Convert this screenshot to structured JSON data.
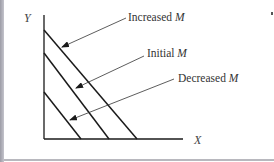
{
  "diagram": {
    "axes": {
      "y_label": "Y",
      "x_label": "X"
    },
    "lines": [
      {
        "name": "Increased M",
        "label_text": "Increased ",
        "label_var": "M",
        "x0": 44,
        "y0": 30,
        "x1": 137,
        "y1": 139
      },
      {
        "name": "Initial M",
        "label_text": "Initial ",
        "label_var": "M",
        "x0": 44,
        "y0": 53,
        "x1": 109,
        "y1": 139
      },
      {
        "name": "Decreased M",
        "label_text": "Decreased ",
        "label_var": "M",
        "x0": 44,
        "y0": 92,
        "x1": 81,
        "y1": 139
      }
    ],
    "colors": {
      "line": "#1a1a1a",
      "text": "#333333",
      "frame": "#b8b8be"
    }
  }
}
